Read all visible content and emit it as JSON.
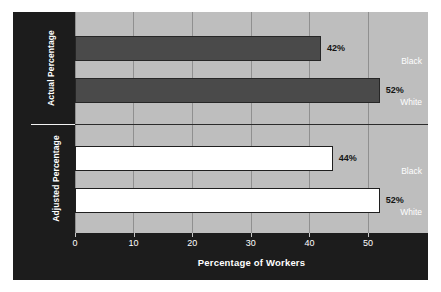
{
  "chart_data": {
    "type": "bar",
    "orientation": "horizontal",
    "title": "",
    "xlabel": "Percentage of Workers",
    "ylabel": "",
    "xlim": [
      0,
      60
    ],
    "xticks": [
      0,
      10,
      20,
      30,
      40,
      50
    ],
    "xtick_labels": [
      "0",
      "10",
      "20",
      "30",
      "40",
      "50"
    ],
    "grid": true,
    "legend": null,
    "groups": [
      {
        "name": "Actual Percentage",
        "style": "dark-fill",
        "categories": [
          "Black",
          "White"
        ],
        "values": [
          42,
          52
        ],
        "value_labels": [
          "42%",
          "52%"
        ]
      },
      {
        "name": "Adjusted Percentage",
        "style": "white-fill",
        "categories": [
          "Black",
          "White"
        ],
        "values": [
          44,
          52
        ],
        "value_labels": [
          "44%",
          "52%"
        ]
      }
    ],
    "colors": {
      "dark_bar": "#4a4a4a",
      "light_bar": "#ffffff",
      "plot_background": "#bebebe",
      "panel_background": "#1c1c1c",
      "gridline": "#909090",
      "bar_outline": "#262626",
      "axis_text": "#ffffff",
      "value_text": "#141414"
    }
  }
}
